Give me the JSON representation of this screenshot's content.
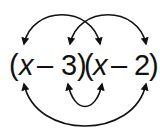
{
  "diagram": {
    "type": "FOIL multiplication diagram",
    "expression": "(x – 3)(x – 2)",
    "factors": [
      {
        "open": "(",
        "term1": "x",
        "op": "–",
        "term2": "3",
        "close": ")"
      },
      {
        "open": "(",
        "term1": "x",
        "op": "–",
        "term2": "2",
        "close": ")"
      }
    ],
    "arrows": [
      {
        "name": "first",
        "from": "x",
        "to": "x",
        "position": "top"
      },
      {
        "name": "outer",
        "from": "x",
        "to": "2",
        "position": "bottom"
      },
      {
        "name": "inner",
        "from": "3",
        "to": "x",
        "position": "bottom"
      },
      {
        "name": "last",
        "from": "3",
        "to": "2",
        "position": "top"
      }
    ],
    "colors": {
      "ink": "#111111",
      "background": "#ffffff"
    }
  }
}
